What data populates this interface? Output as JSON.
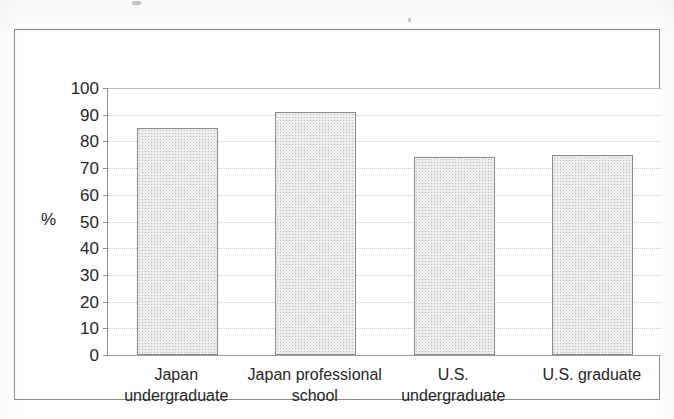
{
  "chart_data": {
    "type": "bar",
    "title": "",
    "xlabel": "",
    "ylabel": "%",
    "ylim": [
      0,
      100
    ],
    "ytick_step": 10,
    "yticks": [
      "100",
      "90",
      "80",
      "70",
      "60",
      "50",
      "40",
      "30",
      "20",
      "10",
      "0"
    ],
    "grid": true,
    "legend": "none",
    "categories": [
      "Japan undergraduate",
      "Japan professional school",
      "U.S. undergraduate",
      "U.S. graduate"
    ],
    "category_lines": [
      [
        "Japan",
        "undergraduate"
      ],
      [
        "Japan professional",
        "school"
      ],
      [
        "U.S.",
        "undergraduate"
      ],
      [
        "U.S. graduate"
      ]
    ],
    "values": [
      85,
      91,
      74,
      75
    ],
    "bar_fill_color": "#ededed",
    "bar_border_color": "#8a8a8a",
    "axis_color": "#8f8f8f",
    "grid_color": "#c9c9c9",
    "frame_color": "#8c8c8c",
    "text_color": "#262626"
  }
}
